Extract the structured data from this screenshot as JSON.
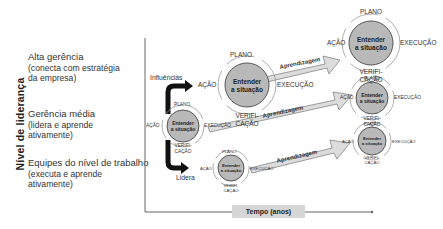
{
  "y_axis": {
    "label": "Nível de liderança"
  },
  "x_axis": {
    "label": "Tempo (anos)"
  },
  "levels": [
    {
      "title": "Alta gerência",
      "desc1": "(conecta com estratégia",
      "desc2": "da empresa)"
    },
    {
      "title": "Gerência média",
      "desc1": "(lidera e aprende",
      "desc2": "ativamente)"
    },
    {
      "title": "Equipes do nível de trabalho",
      "desc1": "(executa e aprende",
      "desc2": "ativamente)"
    }
  ],
  "cycle": {
    "center_line1": "Entender",
    "center_line2": "a situação",
    "top": "PLANO",
    "right": "EXECUÇÃO",
    "bottom_line1": "VERIFI-",
    "bottom_line2": "CAÇÃO",
    "left": "AÇÃO"
  },
  "connectors": {
    "up_label": "Influências",
    "down_label": "Lidera"
  },
  "arrows": {
    "label": "Aprendizagem"
  },
  "colors": {
    "circle_fill": "#b9b9b9",
    "circle_stroke": "#555555",
    "arrow_fill": "#dcdcdc",
    "connector": "#111111"
  }
}
